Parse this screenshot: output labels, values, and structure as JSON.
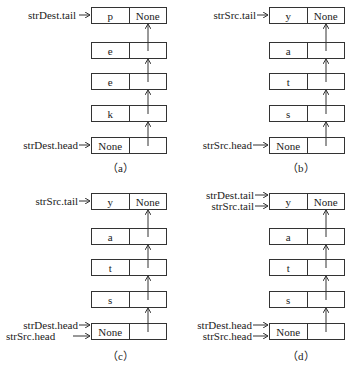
{
  "panels": [
    {
      "id": "a",
      "caption": "（a）",
      "nodes": [
        {
          "value": "p",
          "next": "None"
        },
        {
          "value": "e",
          "next": ""
        },
        {
          "value": "e",
          "next": ""
        },
        {
          "value": "k",
          "next": ""
        },
        {
          "value": "None",
          "next": ""
        }
      ],
      "tail_labels": [
        "strDest.tail"
      ],
      "head_labels": [
        "strDest.head"
      ]
    },
    {
      "id": "b",
      "caption": "（b）",
      "nodes": [
        {
          "value": "y",
          "next": "None"
        },
        {
          "value": "a",
          "next": ""
        },
        {
          "value": "t",
          "next": ""
        },
        {
          "value": "s",
          "next": ""
        },
        {
          "value": "None",
          "next": ""
        }
      ],
      "tail_labels": [
        "strSrc.tail"
      ],
      "head_labels": [
        "strSrc.head"
      ]
    },
    {
      "id": "c",
      "caption": "（c）",
      "nodes": [
        {
          "value": "y",
          "next": "None"
        },
        {
          "value": "a",
          "next": ""
        },
        {
          "value": "t",
          "next": ""
        },
        {
          "value": "s",
          "next": ""
        },
        {
          "value": "None",
          "next": ""
        }
      ],
      "tail_labels": [
        "strSrc.tail"
      ],
      "head_labels": [
        "strDest.head",
        "strSrc.head"
      ]
    },
    {
      "id": "d",
      "caption": "（d）",
      "nodes": [
        {
          "value": "y",
          "next": "None"
        },
        {
          "value": "a",
          "next": ""
        },
        {
          "value": "t",
          "next": ""
        },
        {
          "value": "s",
          "next": ""
        },
        {
          "value": "None",
          "next": ""
        }
      ],
      "tail_labels": [
        "strDest.tail",
        "strSrc.tail"
      ],
      "head_labels": [
        "strDest.head",
        "strSrc.head"
      ]
    }
  ]
}
